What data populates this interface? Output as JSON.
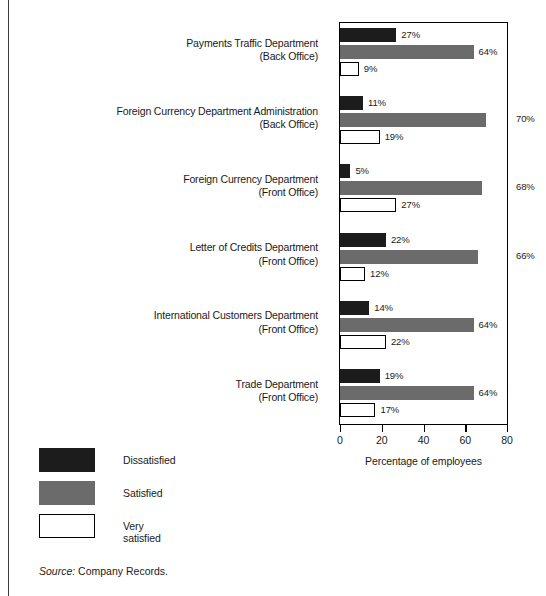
{
  "chart_data": {
    "type": "bar",
    "orientation": "horizontal",
    "title": "",
    "xlabel": "Percentage of employees",
    "ylabel": "",
    "xlim": [
      0,
      80
    ],
    "xticks": [
      "0",
      "20",
      "40",
      "60",
      "80"
    ],
    "grid": false,
    "legend_position": "below-left",
    "categories": [
      "Payments Traffic Department\n(Back Office)",
      "Foreign Currency Department Administration\n(Back Office)",
      "Foreign Currency Department\n(Front Office)",
      "Letter of Credits Department\n(Front Office)",
      "International Customers Department\n(Front Office)",
      "Trade Department\n(Front Office)"
    ],
    "category_lines": [
      [
        "Payments Traffic Department",
        "(Back Office)"
      ],
      [
        "Foreign Currency Department Administration",
        "(Back Office)"
      ],
      [
        "Foreign Currency Department",
        "(Front Office)"
      ],
      [
        "Letter of Credits Department",
        "(Front Office)"
      ],
      [
        "International Customers Department",
        "(Front Office)"
      ],
      [
        "Trade Department",
        "(Front Office)"
      ]
    ],
    "series": [
      {
        "name": "Dissatisfied",
        "color": "#1c1c1c",
        "values": [
          27,
          11,
          5,
          22,
          14,
          19
        ]
      },
      {
        "name": "Satisfied",
        "color": "#6b6b6b",
        "values": [
          64,
          70,
          68,
          66,
          64,
          64
        ]
      },
      {
        "name": "Very satisfied",
        "color": "#ffffff",
        "values": [
          9,
          19,
          27,
          12,
          22,
          17
        ]
      }
    ],
    "data_labels": [
      [
        "27%",
        "11%",
        "5%",
        "22%",
        "14%",
        "19%"
      ],
      [
        "64%",
        "70%",
        "68%",
        "66%",
        "64%",
        "64%"
      ],
      [
        "9%",
        "19%",
        "27%",
        "12%",
        "22%",
        "17%"
      ]
    ]
  },
  "legend": {
    "items": [
      {
        "label": "Dissatisfied"
      },
      {
        "label": "Satisfied"
      },
      {
        "label": "Very satisfied"
      }
    ]
  },
  "source": {
    "prefix": "Source:",
    "text": "Company Records."
  }
}
